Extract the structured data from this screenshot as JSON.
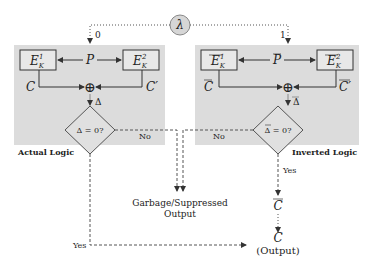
{
  "diagram": {
    "selector": {
      "symbol": "λ",
      "branch_left": "0",
      "branch_right": "1"
    },
    "left_panel": {
      "label": "Actual Logic",
      "enc1": {
        "base": "E",
        "sub": "K",
        "sup": "1"
      },
      "enc2": {
        "base": "E",
        "sub": "K",
        "sup": "2"
      },
      "input": "P",
      "out1": "C",
      "out2": "C′",
      "xor": "⊕",
      "delta": "Δ",
      "decision": "Δ = 0?",
      "no_label": "No",
      "yes_label": "Yes"
    },
    "right_panel": {
      "label": "Inverted Logic",
      "enc1": {
        "base": "E",
        "sub": "K",
        "sup": "1"
      },
      "enc2": {
        "base": "E",
        "sub": "K",
        "sup": "2"
      },
      "input": "P",
      "out1": "C",
      "out2": "C′",
      "xor": "⊕",
      "delta": "Δ",
      "decision": "Δ = 0?",
      "no_label": "No",
      "yes_label": "Yes"
    },
    "garbage": {
      "line1": "Garbage/Suppressed",
      "line2": "Output"
    },
    "inverted_output": "C",
    "final_output": {
      "symbol": "C",
      "label": "(Output)"
    },
    "colors": {
      "panel_bg": "#dcdcdc",
      "box_bg": "#e8e8e8",
      "stroke": "#333333",
      "lambda_bg": "#d6d6d6"
    }
  }
}
